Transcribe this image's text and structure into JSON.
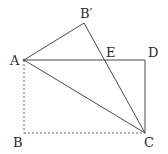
{
  "diagram": {
    "type": "geometry-folded-rectangle",
    "points": {
      "A": "A",
      "B": "B",
      "B_prime": "B′",
      "C": "C",
      "D": "D",
      "E": "E"
    },
    "segments_solid": [
      "AB′",
      "B′C",
      "AD",
      "DC",
      "AC"
    ],
    "segments_dashed": [
      "AB",
      "BC"
    ],
    "colors": {
      "line": "#4a4a4a",
      "dashed": "#666666",
      "text": "#2a2a2a"
    }
  }
}
